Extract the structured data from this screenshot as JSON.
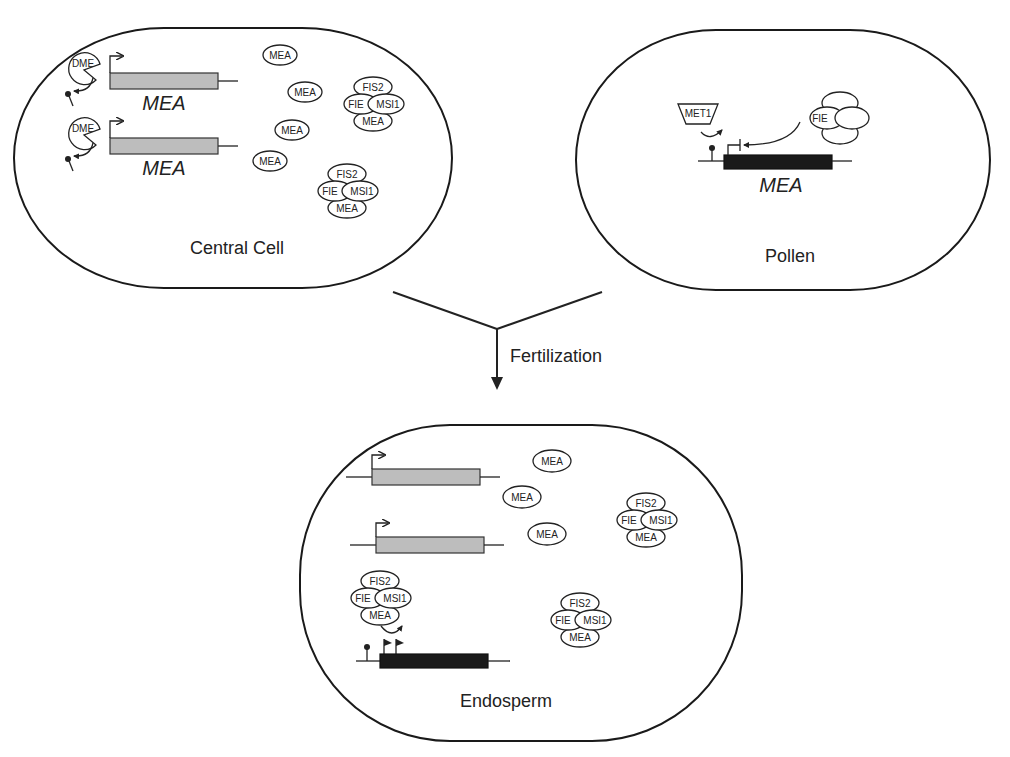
{
  "figure": {
    "central_cell": {
      "label": "Central Cell",
      "genes": [
        {
          "label": "MEA",
          "enzyme": "DME",
          "state": "active-maternal"
        },
        {
          "label": "MEA",
          "enzyme": "DME",
          "state": "active-maternal"
        }
      ],
      "free_proteins": [
        "MEA",
        "MEA",
        "MEA",
        "MEA"
      ],
      "complexes": [
        {
          "top": "FIS2",
          "left": "FIE",
          "right": "MSI1",
          "bottom": "MEA"
        },
        {
          "top": "FIS2",
          "left": "FIE",
          "right": "MSI1",
          "bottom": "MEA"
        }
      ]
    },
    "pollen": {
      "label": "Pollen",
      "gene": {
        "label": "MEA",
        "state": "silenced-paternal"
      },
      "methyltransferase": "MET1",
      "complex_visible_label": "FIE"
    },
    "transition": {
      "label": "Fertilization"
    },
    "endosperm": {
      "label": "Endosperm",
      "free_proteins": [
        "MEA",
        "MEA",
        "MEA"
      ],
      "complexes": [
        {
          "top": "FIS2",
          "left": "FIE",
          "right": "MSI1",
          "bottom": "MEA"
        },
        {
          "top": "FIS2",
          "left": "FIE",
          "right": "MSI1",
          "bottom": "MEA"
        },
        {
          "top": "FIS2",
          "left": "FIE",
          "right": "MSI1",
          "bottom": "MEA"
        }
      ]
    },
    "colors": {
      "outline": "#1a1a1a",
      "active_gene": "#bdbdbd",
      "silenced_gene": "#1a1a1a",
      "background": "#ffffff"
    }
  }
}
